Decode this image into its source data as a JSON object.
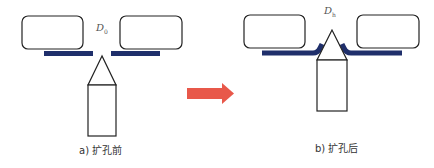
{
  "panels": [
    {
      "id": "before",
      "caption": "a) 扩孔前",
      "diameter_label": "D",
      "diameter_subscript": "0"
    },
    {
      "id": "after",
      "caption": "b) 扩孔后",
      "diameter_label": "D",
      "diameter_subscript": "h"
    }
  ],
  "colors": {
    "plate": "#1f2f6b",
    "arrow": "#e8584a",
    "outline": "#222222"
  }
}
